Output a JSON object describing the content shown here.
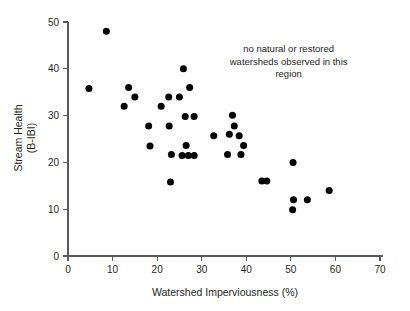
{
  "chart_data": {
    "type": "scatter",
    "title": "",
    "xlabel": "Watershed Imperviousness (%)",
    "ylabel_line1": "Stream Health",
    "ylabel_line2": "(B-IBI)",
    "ylabel": "Stream Health (B-IBI)",
    "xlim": [
      0,
      70
    ],
    "ylim": [
      0,
      50
    ],
    "xticks": [
      0,
      10,
      20,
      30,
      40,
      50,
      60,
      70
    ],
    "yticks": [
      0,
      10,
      20,
      30,
      40,
      50
    ],
    "xtick_labels": [
      "0",
      "10",
      "20",
      "30",
      "40",
      "50",
      "60",
      "70"
    ],
    "ytick_labels": [
      "0",
      "10",
      "20",
      "30",
      "40",
      "50"
    ],
    "grid": false,
    "legend": null,
    "marker": "filled-circle",
    "marker_color": "#000000",
    "marker_size_px": 4.6,
    "annotations": [
      {
        "name": "no-data-region-note",
        "lines": [
          "no natural or restored",
          "watersheds observed in this",
          "region"
        ],
        "x": 49.5,
        "y": 43.5,
        "align": "center"
      }
    ],
    "points": [
      {
        "x": 4.7,
        "y": 35.8
      },
      {
        "x": 8.6,
        "y": 48.0
      },
      {
        "x": 12.6,
        "y": 32.0
      },
      {
        "x": 13.6,
        "y": 36.0
      },
      {
        "x": 15.0,
        "y": 34.0
      },
      {
        "x": 18.1,
        "y": 27.8
      },
      {
        "x": 18.4,
        "y": 23.5
      },
      {
        "x": 20.9,
        "y": 32.0
      },
      {
        "x": 22.6,
        "y": 34.0
      },
      {
        "x": 22.7,
        "y": 27.8
      },
      {
        "x": 23.2,
        "y": 21.7
      },
      {
        "x": 23.0,
        "y": 15.8
      },
      {
        "x": 25.0,
        "y": 34.0
      },
      {
        "x": 25.6,
        "y": 21.5
      },
      {
        "x": 25.9,
        "y": 40.0
      },
      {
        "x": 26.3,
        "y": 29.8
      },
      {
        "x": 26.5,
        "y": 23.6
      },
      {
        "x": 27.0,
        "y": 21.5
      },
      {
        "x": 27.3,
        "y": 36.0
      },
      {
        "x": 28.3,
        "y": 21.5
      },
      {
        "x": 28.3,
        "y": 29.8
      },
      {
        "x": 32.7,
        "y": 25.7
      },
      {
        "x": 35.8,
        "y": 21.7
      },
      {
        "x": 36.2,
        "y": 26.0
      },
      {
        "x": 36.9,
        "y": 30.1
      },
      {
        "x": 37.3,
        "y": 27.8
      },
      {
        "x": 38.4,
        "y": 25.7
      },
      {
        "x": 38.8,
        "y": 21.7
      },
      {
        "x": 39.4,
        "y": 23.6
      },
      {
        "x": 43.5,
        "y": 16.0
      },
      {
        "x": 44.6,
        "y": 16.0
      },
      {
        "x": 50.5,
        "y": 20.0
      },
      {
        "x": 50.6,
        "y": 12.0
      },
      {
        "x": 50.4,
        "y": 9.9
      },
      {
        "x": 53.7,
        "y": 12.0
      },
      {
        "x": 58.6,
        "y": 14.0
      }
    ]
  },
  "colors": {
    "marker": "#000000",
    "axis": "#58595b",
    "text": "#231f20",
    "background": "#ffffff"
  }
}
